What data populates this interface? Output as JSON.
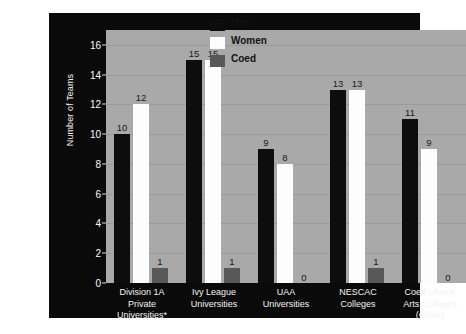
{
  "chart_data": {
    "type": "bar",
    "title": "",
    "xlabel": "",
    "ylabel": "Number of Teams",
    "ylim": [
      0,
      17
    ],
    "yticks": [
      0,
      2,
      4,
      6,
      8,
      10,
      12,
      14,
      16
    ],
    "grid": true,
    "legend_position": "top-center",
    "categories": [
      "Division 1A Private Universities*",
      "Ivy League Universities",
      "UAA Universities",
      "NESCAC Colleges",
      "Coed Liberal Arts Colleges (Other)"
    ],
    "category_lines": [
      [
        "Division 1A",
        "Private",
        "Universities*"
      ],
      [
        "Ivy League",
        "Universities"
      ],
      [
        "UAA",
        "Universities"
      ],
      [
        "NESCAC",
        "Colleges"
      ],
      [
        "Coed Liberal",
        "Arts Colleges",
        "(Other)"
      ]
    ],
    "series": [
      {
        "name": "Men",
        "color": "#0d0d0d",
        "values": [
          10,
          15,
          9,
          13,
          11
        ]
      },
      {
        "name": "Women",
        "color": "#fdfdfd",
        "values": [
          12,
          15,
          8,
          13,
          9
        ]
      },
      {
        "name": "Coed",
        "color": "#585858",
        "values": [
          1,
          1,
          0,
          1,
          0
        ]
      }
    ]
  },
  "colors": {
    "panel_background": "#0a0a0a",
    "plot_background": "#a9a9a9",
    "gridline": "#9a9a9a",
    "axis_text": "#fafafa",
    "value_text": "#1a1a1a"
  }
}
